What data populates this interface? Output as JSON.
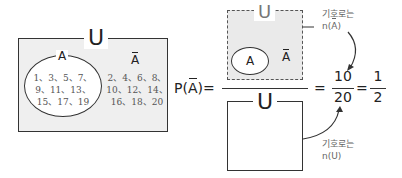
{
  "left_diagram": {
    "universe_label": "U",
    "set_label": "A",
    "complement_label": "A",
    "set_elements": [
      "1、3、5、7、",
      "9、11、13、",
      "15、17、19"
    ],
    "complement_elements": [
      "2、4、6、8、",
      "10、12、14、",
      "16、18、20"
    ]
  },
  "formula": {
    "lhs_p": "P",
    "lhs_arg": "A",
    "lhs_equals": "=",
    "numerator_universe_label": "U",
    "numerator_set_label": "A",
    "numerator_complement_label": "A",
    "denominator_universe_label": "U",
    "eq2": "=",
    "frac1_num": "10",
    "frac1_den": "20",
    "eq3": "=",
    "frac2_num": "1",
    "frac2_den": "2"
  },
  "annotations": {
    "top_note_line1": "기호로는",
    "top_note_line2_prefix": "n(",
    "top_note_line2_arg": "A",
    "top_note_line2_suffix": ")",
    "bottom_note_line1": "기호로는",
    "bottom_note_line2": "n(U)"
  },
  "colors": {
    "shade_gray": "#efefef",
    "dash_gray": "#eaeaea",
    "line": "#333333",
    "text_gray": "#555555"
  }
}
